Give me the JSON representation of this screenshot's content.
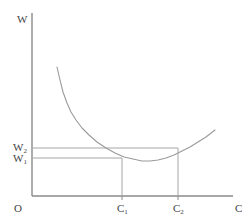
{
  "figure": {
    "background_color": "#ffffff",
    "line_color": "#9a9a9a",
    "axis_color": "#8a8a8a",
    "text_color": "#444444"
  },
  "labels": {
    "y_axis": "W",
    "x_axis": "C",
    "origin": "O",
    "w_upper_main": "W",
    "w_upper_sub": "2",
    "w_lower_main": "W",
    "w_lower_sub": "1",
    "c_first_main": "C",
    "c_first_sub": "1",
    "c_second_main": "C",
    "c_second_sub": "2"
  },
  "chart_data": {
    "type": "line",
    "title": "",
    "xlabel": "C",
    "ylabel": "W",
    "grid": false,
    "legend": null,
    "axes": {
      "origin_label": "O",
      "x_axis_from_px": [
        32,
        196
      ],
      "x_axis_to_px": [
        233,
        196
      ],
      "y_axis_from_px": [
        32,
        196
      ],
      "y_axis_to_px": [
        32,
        13
      ]
    },
    "series": [
      {
        "name": "U-shaped curve",
        "description": "Steeply falling then gently rising convex curve (average cost type)",
        "points_px": [
          [
            57,
            67
          ],
          [
            60,
            80
          ],
          [
            63,
            92
          ],
          [
            67,
            103
          ],
          [
            71,
            112
          ],
          [
            76,
            120
          ],
          [
            82,
            128
          ],
          [
            89,
            135
          ],
          [
            97,
            142
          ],
          [
            106,
            148
          ],
          [
            115,
            153
          ],
          [
            124,
            157
          ],
          [
            133,
            159
          ],
          [
            142,
            161
          ],
          [
            150,
            161
          ],
          [
            158,
            160
          ],
          [
            166,
            158
          ],
          [
            174,
            155
          ],
          [
            182,
            151
          ],
          [
            190,
            147
          ],
          [
            198,
            142
          ],
          [
            206,
            137
          ],
          [
            215,
            130
          ]
        ]
      }
    ],
    "reference_lines": [
      {
        "name": "W2-horizontal",
        "orientation": "horizontal",
        "value_label": "W2",
        "y_px": 148,
        "from_x_px": 32,
        "to_x_px": 178
      },
      {
        "name": "W1-horizontal",
        "orientation": "horizontal",
        "value_label": "W1",
        "y_px": 158,
        "from_x_px": 32,
        "to_x_px": 122
      },
      {
        "name": "C1-vertical",
        "orientation": "vertical",
        "value_label": "C1",
        "x_px": 122,
        "from_y_px": 158,
        "to_y_px": 196
      },
      {
        "name": "C2-vertical",
        "orientation": "vertical",
        "value_label": "C2",
        "x_px": 178,
        "from_y_px": 148,
        "to_y_px": 196
      }
    ],
    "tick_marks": [
      {
        "axis": "x",
        "label": "C1",
        "x_px": 122
      },
      {
        "axis": "x",
        "label": "C2",
        "x_px": 178
      }
    ],
    "y_tick_labels": [
      "W1",
      "W2"
    ],
    "x_tick_labels": [
      "C1",
      "C2"
    ],
    "annotations": [
      "W1 intersects the falling branch of the curve at C1",
      "W2 intersects the rising branch of the curve at C2"
    ]
  }
}
